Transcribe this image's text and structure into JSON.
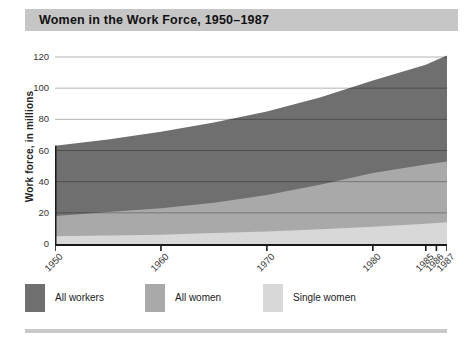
{
  "title_bar": {
    "text": "Women in the Work Force, 1950–1987"
  },
  "axes": {
    "y_label": "Work force, in millions"
  },
  "legend": {
    "items": [
      {
        "label": "All workers",
        "color": "#6f6f6f"
      },
      {
        "label": "All women",
        "color": "#a9a9a9"
      },
      {
        "label": "Single women",
        "color": "#d8d8d8"
      }
    ]
  },
  "colors": {
    "title_bar_bg": "#c6c6c6",
    "axis": "#1a1a1a",
    "gridline": "rgba(0,0,0,0.3)",
    "bottom_rule": "#c9c9c9"
  },
  "chart_data": {
    "type": "area",
    "title": "Women in the Work Force, 1950–1987",
    "xlabel": "",
    "ylabel": "Work force, in millions",
    "x": [
      1950,
      1955,
      1960,
      1965,
      1970,
      1975,
      1980,
      1985,
      1986,
      1987
    ],
    "series": [
      {
        "name": "All workers",
        "color": "#6f6f6f",
        "values": [
          63,
          67,
          72,
          78,
          85,
          94,
          105,
          115,
          118,
          121
        ]
      },
      {
        "name": "All women",
        "color": "#a9a9a9",
        "values": [
          18,
          20.5,
          23,
          26.5,
          31.5,
          38,
          45.5,
          51,
          52,
          53
        ]
      },
      {
        "name": "Single women",
        "color": "#d8d8d8",
        "values": [
          5,
          5.5,
          6,
          7,
          8,
          9.5,
          11,
          13,
          13.5,
          14
        ]
      }
    ],
    "xlim": [
      1950,
      1987
    ],
    "ylim": [
      0,
      120
    ],
    "y_ticks": [
      0,
      20,
      40,
      60,
      80,
      100,
      120
    ],
    "x_tick_years": [
      1950,
      1960,
      1970,
      1980,
      1985,
      1986,
      1987
    ],
    "grid": true,
    "legend_position": "bottom"
  }
}
